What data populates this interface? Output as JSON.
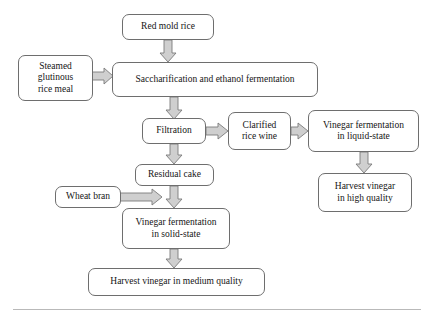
{
  "diagram": {
    "background_color": "#ffffff",
    "box_border_color": "#6e6e6e",
    "arrow_fill_color": "#cfcfcf",
    "arrow_stroke_color": "#7a7a7a",
    "rule_color": "#b9b9b9",
    "nodes": [
      {
        "id": "red-mold-rice",
        "label": "Red mold rice"
      },
      {
        "id": "steamed-glutinous-rice-meal",
        "label": "Steamed\nglutinous\nrice meal",
        "lines": [
          "Steamed",
          "glutinous",
          "rice meal"
        ]
      },
      {
        "id": "saccharification-and-ethanol-fermentation",
        "label": "Saccharification and ethanol fermentation"
      },
      {
        "id": "filtration",
        "label": "Filtration"
      },
      {
        "id": "clarified-rice-wine",
        "label": "Clarified\nrice wine",
        "lines": [
          "Clarified",
          "rice wine"
        ]
      },
      {
        "id": "vinegar-fermentation-in-liquid-state",
        "label": "Vinegar fermentation\nin liquid-state",
        "lines": [
          "Vinegar fermentation",
          "in liquid-state"
        ]
      },
      {
        "id": "harvest-vinegar-in-high-quality",
        "label": "Harvest vinegar\nin high quality",
        "lines": [
          "Harvest vinegar",
          "in high quality"
        ]
      },
      {
        "id": "residual-cake",
        "label": "Residual cake"
      },
      {
        "id": "wheat-bran",
        "label": "Wheat bran"
      },
      {
        "id": "vinegar-fermentation-in-solid-state",
        "label": "Vinegar fermentation\nin solid-state",
        "lines": [
          "Vinegar fermentation",
          "in solid-state"
        ]
      },
      {
        "id": "harvest-vinegar-in-medium-quality",
        "label": "Harvest vinegar in medium quality"
      }
    ],
    "edges": [
      {
        "from": "red-mold-rice",
        "to": "saccharification-and-ethanol-fermentation",
        "direction": "down"
      },
      {
        "from": "steamed-glutinous-rice-meal",
        "to": "saccharification-and-ethanol-fermentation",
        "direction": "right"
      },
      {
        "from": "saccharification-and-ethanol-fermentation",
        "to": "filtration",
        "direction": "down"
      },
      {
        "from": "filtration",
        "to": "clarified-rice-wine",
        "direction": "right"
      },
      {
        "from": "clarified-rice-wine",
        "to": "vinegar-fermentation-in-liquid-state",
        "direction": "right"
      },
      {
        "from": "vinegar-fermentation-in-liquid-state",
        "to": "harvest-vinegar-in-high-quality",
        "direction": "down"
      },
      {
        "from": "filtration",
        "to": "residual-cake",
        "direction": "down"
      },
      {
        "from": "residual-cake",
        "to": "vinegar-fermentation-in-solid-state",
        "direction": "down"
      },
      {
        "from": "wheat-bran",
        "to": "vinegar-fermentation-in-solid-state",
        "direction": "right"
      },
      {
        "from": "vinegar-fermentation-in-solid-state",
        "to": "harvest-vinegar-in-medium-quality",
        "direction": "down"
      }
    ]
  },
  "nodes": {
    "red_mold_rice": {
      "label": "Red mold rice"
    },
    "steamed_glutinous_rice_meal": {
      "line1": "Steamed",
      "line2": "glutinous",
      "line3": "rice meal"
    },
    "saccharification": {
      "label": "Saccharification and ethanol fermentation"
    },
    "filtration": {
      "label": "Filtration"
    },
    "clarified_rice_wine": {
      "line1": "Clarified",
      "line2": "rice wine"
    },
    "vinegar_liquid": {
      "line1": "Vinegar fermentation",
      "line2": "in liquid-state"
    },
    "harvest_high": {
      "line1": "Harvest vinegar",
      "line2": "in high quality"
    },
    "residual_cake": {
      "label": "Residual cake"
    },
    "wheat_bran": {
      "label": "Wheat bran"
    },
    "vinegar_solid": {
      "line1": "Vinegar fermentation",
      "line2": "in solid-state"
    },
    "harvest_medium": {
      "label": "Harvest vinegar in medium quality"
    }
  }
}
